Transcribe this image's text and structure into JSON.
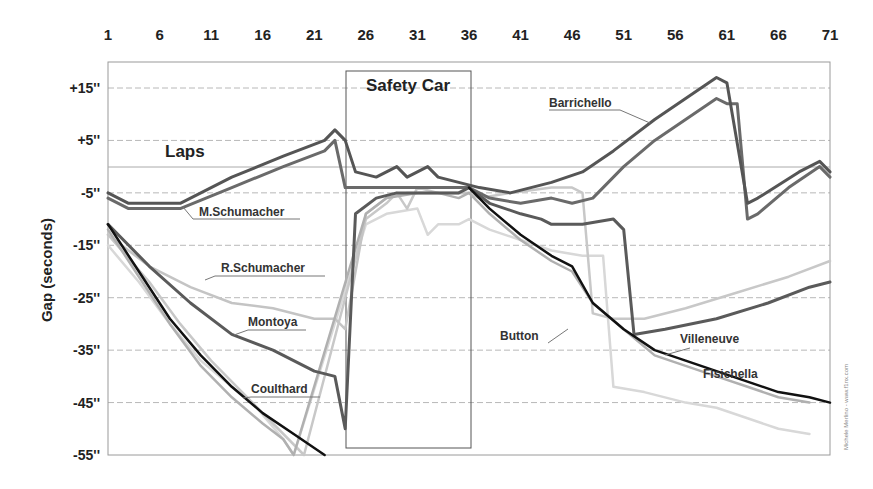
{
  "chart_data": {
    "type": "line",
    "title": "",
    "xlabel": "Laps",
    "ylabel": "Gap (seconds)",
    "x_ticks": [
      "1",
      "6",
      "11",
      "16",
      "21",
      "26",
      "31",
      "36",
      "41",
      "46",
      "51",
      "56",
      "61",
      "66",
      "71"
    ],
    "y_ticks": [
      "+15''",
      "+5''",
      "-5''",
      "-15''",
      "-25''",
      "-35''",
      "-45''",
      "-55''"
    ],
    "xlim": [
      1,
      71
    ],
    "ylim": [
      -55,
      19
    ],
    "grid": true,
    "legend_position": "inline labels",
    "annotations": [
      {
        "text": "Safety Car",
        "x_range": [
          24,
          36
        ]
      },
      {
        "text": "Laps",
        "x": 6,
        "y": 1
      }
    ],
    "credit": "Michele Merlino - www.f1nx.com",
    "series": [
      {
        "name": "Barrichello",
        "color": "#555555",
        "width": 3,
        "points": [
          [
            1,
            -5
          ],
          [
            3,
            -7
          ],
          [
            8,
            -7
          ],
          [
            13,
            -2
          ],
          [
            18,
            2
          ],
          [
            22,
            5
          ],
          [
            23,
            7
          ],
          [
            24,
            5
          ],
          [
            25,
            -1
          ],
          [
            27,
            -2
          ],
          [
            29,
            0
          ],
          [
            30,
            -2
          ],
          [
            32,
            0
          ],
          [
            33,
            -2
          ],
          [
            35,
            -3
          ],
          [
            37,
            -4
          ],
          [
            40,
            -5
          ],
          [
            44,
            -3
          ],
          [
            47,
            -1
          ],
          [
            50,
            3
          ],
          [
            54,
            9
          ],
          [
            57,
            13
          ],
          [
            60,
            17
          ],
          [
            61,
            16
          ],
          [
            63,
            -7
          ],
          [
            64,
            -6
          ],
          [
            68,
            -1
          ],
          [
            70,
            1
          ],
          [
            71,
            -1
          ]
        ]
      },
      {
        "name": "M.Schumacher",
        "color": "#6a6a6a",
        "width": 3,
        "points": [
          [
            1,
            -6
          ],
          [
            3,
            -8
          ],
          [
            8,
            -8
          ],
          [
            13,
            -4
          ],
          [
            18,
            0
          ],
          [
            22,
            3
          ],
          [
            23,
            5
          ],
          [
            24,
            -4
          ],
          [
            36,
            -4
          ],
          [
            38,
            -6
          ],
          [
            41,
            -7
          ],
          [
            44,
            -6
          ],
          [
            46,
            -7
          ],
          [
            48,
            -6
          ],
          [
            51,
            0
          ],
          [
            54,
            5
          ],
          [
            57,
            9
          ],
          [
            60,
            13
          ],
          [
            61,
            12
          ],
          [
            62,
            12
          ],
          [
            63,
            -10
          ],
          [
            64,
            -9
          ],
          [
            67,
            -4
          ],
          [
            70,
            0
          ],
          [
            71,
            -2
          ]
        ]
      },
      {
        "name": "Montoya",
        "color": "#5a5a5a",
        "width": 3,
        "points": [
          [
            1,
            -11
          ],
          [
            5,
            -19
          ],
          [
            9,
            -26
          ],
          [
            13,
            -32
          ],
          [
            17,
            -35
          ],
          [
            21,
            -39
          ],
          [
            23,
            -40
          ],
          [
            24,
            -50
          ],
          [
            25,
            -9
          ],
          [
            27,
            -6
          ],
          [
            29,
            -5
          ],
          [
            33,
            -5
          ],
          [
            35,
            -5
          ],
          [
            36,
            -4
          ],
          [
            38,
            -7
          ],
          [
            41,
            -9
          ],
          [
            43,
            -10
          ],
          [
            44,
            -11
          ],
          [
            47,
            -11
          ],
          [
            50,
            -10
          ],
          [
            51,
            -12
          ],
          [
            52,
            -32
          ],
          [
            55,
            -31
          ],
          [
            60,
            -29
          ],
          [
            65,
            -26
          ],
          [
            69,
            -23
          ],
          [
            71,
            -22
          ]
        ]
      },
      {
        "name": "R.Schumacher",
        "color": "#c4c4c4",
        "width": 2.5,
        "points": [
          [
            1,
            -13
          ],
          [
            5,
            -19
          ],
          [
            9,
            -23
          ],
          [
            13,
            -26
          ],
          [
            17,
            -27
          ],
          [
            21,
            -29
          ],
          [
            23,
            -29
          ],
          [
            24,
            -31
          ],
          [
            26,
            -9
          ],
          [
            28,
            -6
          ],
          [
            30,
            -5
          ],
          [
            33,
            -5
          ],
          [
            35,
            -5
          ],
          [
            36,
            -5
          ]
        ]
      },
      {
        "name": "Coulthard",
        "color": "#111111",
        "width": 2.5,
        "points": [
          [
            1,
            -11
          ],
          [
            4,
            -20
          ],
          [
            7,
            -29
          ],
          [
            10,
            -36
          ],
          [
            13,
            -42
          ],
          [
            16,
            -47
          ],
          [
            19,
            -51
          ],
          [
            22,
            -55
          ]
        ]
      },
      {
        "name": "Coulthard-2nd-half",
        "color": "#111111",
        "width": 2.5,
        "points": [
          [
            36,
            -4
          ],
          [
            38,
            -8
          ],
          [
            41,
            -13
          ],
          [
            44,
            -17
          ],
          [
            46,
            -19
          ],
          [
            48,
            -26
          ],
          [
            51,
            -31
          ],
          [
            54,
            -35
          ],
          [
            57,
            -37
          ],
          [
            60,
            -39
          ],
          [
            63,
            -41
          ],
          [
            66,
            -43
          ],
          [
            69,
            -44
          ],
          [
            71,
            -45
          ]
        ]
      },
      {
        "name": "Button",
        "color": "#b0b0b0",
        "width": 2.5,
        "points": [
          [
            1,
            -12
          ],
          [
            4,
            -21
          ],
          [
            7,
            -30
          ],
          [
            10,
            -38
          ],
          [
            13,
            -44
          ],
          [
            16,
            -49
          ],
          [
            18,
            -52
          ],
          [
            19,
            -55
          ],
          [
            26,
            -9
          ],
          [
            28,
            -6
          ],
          [
            31,
            -5
          ],
          [
            33,
            -5
          ],
          [
            35,
            -6
          ],
          [
            36,
            -5
          ],
          [
            38,
            -9
          ],
          [
            41,
            -14
          ],
          [
            44,
            -18
          ],
          [
            46,
            -20
          ],
          [
            48,
            -26
          ],
          [
            51,
            -31
          ],
          [
            54,
            -36
          ],
          [
            57,
            -38
          ],
          [
            60,
            -40
          ],
          [
            63,
            -42
          ],
          [
            66,
            -44
          ],
          [
            69,
            -45
          ]
        ]
      },
      {
        "name": "Villeneuve",
        "color": "#c8c8c8",
        "width": 2.5,
        "points": [
          [
            1,
            -13
          ],
          [
            5,
            -22
          ],
          [
            8,
            -30
          ],
          [
            11,
            -37
          ],
          [
            14,
            -43
          ],
          [
            17,
            -49
          ],
          [
            19,
            -53
          ],
          [
            20,
            -55
          ],
          [
            26,
            -10
          ],
          [
            28,
            -7
          ],
          [
            29,
            -5
          ],
          [
            30,
            -8
          ],
          [
            31,
            -4
          ],
          [
            33,
            -5
          ],
          [
            36,
            -5
          ],
          [
            37,
            -6
          ],
          [
            40,
            -5
          ],
          [
            44,
            -4
          ],
          [
            46,
            -4
          ],
          [
            47,
            -5
          ],
          [
            48,
            -28
          ],
          [
            50,
            -29
          ],
          [
            53,
            -29
          ],
          [
            57,
            -27
          ],
          [
            62,
            -24
          ],
          [
            67,
            -21
          ],
          [
            71,
            -18
          ]
        ]
      },
      {
        "name": "Fisichella",
        "color": "#d8d8d8",
        "width": 2.5,
        "points": [
          [
            1,
            -15
          ],
          [
            4,
            -22
          ],
          [
            7,
            -30
          ],
          [
            10,
            -37
          ],
          [
            13,
            -42
          ],
          [
            15,
            -45
          ],
          [
            18,
            -52
          ],
          [
            19,
            -55
          ],
          [
            26,
            -11
          ],
          [
            28,
            -9
          ],
          [
            31,
            -8
          ],
          [
            32,
            -13
          ],
          [
            33,
            -11
          ],
          [
            35,
            -11
          ],
          [
            36,
            -10
          ],
          [
            38,
            -12
          ],
          [
            41,
            -14
          ],
          [
            44,
            -16
          ],
          [
            47,
            -17
          ],
          [
            49,
            -17
          ],
          [
            50,
            -42
          ],
          [
            53,
            -43
          ],
          [
            57,
            -45
          ],
          [
            60,
            -46
          ],
          [
            63,
            -48
          ],
          [
            66,
            -50
          ],
          [
            69,
            -51
          ]
        ]
      }
    ]
  },
  "labels": {
    "laps": "Laps",
    "safety_car": "Safety Car",
    "ylabel": "Gap (seconds)",
    "barrichello": "Barrichello",
    "m_schumacher": "M.Schumacher",
    "r_schumacher": "R.Schumacher",
    "montoya": "Montoya",
    "coulthard": "Coulthard",
    "button": "Button",
    "villeneuve": "Villeneuve",
    "fisichella": "Fisichella",
    "credit": "Michele Merlino - www.f1nx.com"
  }
}
